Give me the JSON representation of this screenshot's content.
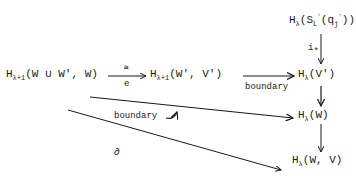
{
  "diagram": {
    "type": "commutative-diagram",
    "nodes": {
      "top_right": {
        "H": "H",
        "sub": "λ",
        "arg": "(S",
        "arg_sub": "L",
        "arg_sup": "'",
        "arg2": "(q",
        "arg2_sub": "j",
        "arg2_sup": "'",
        "close": "))"
      },
      "left": {
        "H": "H",
        "sub": "λ+1",
        "arg": "(W ∪ W', W)"
      },
      "middle": {
        "H": "H",
        "sub": "λ+1",
        "arg": "(W', V')"
      },
      "right_v": {
        "H": "H",
        "sub": "λ",
        "arg": "(V')"
      },
      "right_w": {
        "H": "H",
        "sub": "λ",
        "arg": "(W)"
      },
      "right_wv": {
        "H": "H",
        "sub": "λ",
        "arg": "(W, V)"
      }
    },
    "arrows": {
      "e_top": "≅",
      "e_bottom": "e",
      "boundary_top": "boundary",
      "i_star": "i",
      "i_star_sub": "*",
      "boundary_diag": "boundary",
      "partial": "∂"
    }
  }
}
